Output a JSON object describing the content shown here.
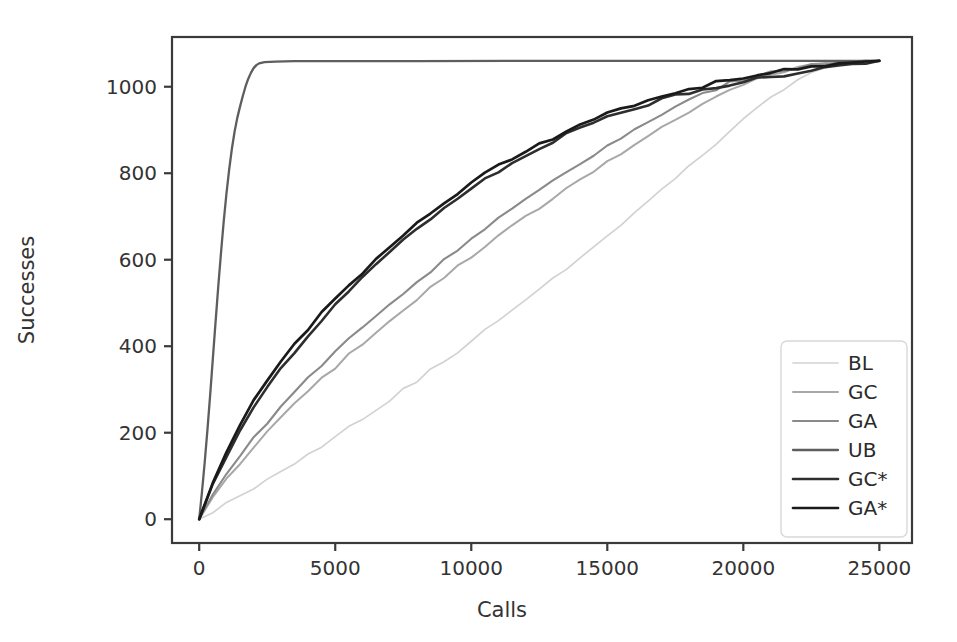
{
  "chart_data": {
    "type": "line",
    "title": "",
    "xlabel": "Calls",
    "ylabel": "Successes",
    "xlim": [
      -1000,
      26200
    ],
    "ylim": [
      -55,
      1115
    ],
    "xticks": [
      0,
      5000,
      10000,
      15000,
      20000,
      25000
    ],
    "xtick_labels": [
      "0",
      "5000",
      "10000",
      "15000",
      "20000",
      "25000"
    ],
    "yticks": [
      0,
      200,
      400,
      600,
      800,
      1000
    ],
    "ytick_labels": [
      "0",
      "200",
      "400",
      "600",
      "800",
      "1000"
    ],
    "grid": false,
    "legend_position": "lower right",
    "max_successes": 1060,
    "series": [
      {
        "name": "BL",
        "color": "#d2d2d2",
        "width": 1.7,
        "x": [
          0,
          500,
          1000,
          1500,
          2000,
          2500,
          3000,
          3500,
          4000,
          4500,
          5000,
          5500,
          6000,
          6500,
          7000,
          7500,
          8000,
          8500,
          9000,
          9500,
          10000,
          10500,
          11000,
          11500,
          12000,
          12500,
          13000,
          13500,
          14000,
          14500,
          15000,
          15500,
          16000,
          16500,
          17000,
          17500,
          18000,
          18500,
          19000,
          19500,
          20000,
          20500,
          21000,
          21500,
          22000,
          22500,
          23000,
          23500,
          24000,
          24500,
          25000
        ],
        "y": [
          0,
          18,
          36,
          54,
          73,
          92,
          111,
          131,
          151,
          171,
          192,
          213,
          234,
          255,
          277,
          299,
          321,
          343,
          366,
          389,
          412,
          435,
          459,
          483,
          507,
          531,
          556,
          581,
          606,
          631,
          657,
          683,
          709,
          735,
          762,
          789,
          816,
          843,
          871,
          899,
          927,
          953,
          975,
          995,
          1014,
          1029,
          1041,
          1050,
          1056,
          1059,
          1060
        ]
      },
      {
        "name": "GC",
        "color": "#a8a8a8",
        "width": 2.0,
        "x": [
          0,
          500,
          1000,
          1500,
          2000,
          2500,
          3000,
          3500,
          4000,
          4500,
          5000,
          5500,
          6000,
          6500,
          7000,
          7500,
          8000,
          8500,
          9000,
          9500,
          10000,
          10500,
          11000,
          11500,
          12000,
          12500,
          13000,
          13500,
          14000,
          14500,
          15000,
          15500,
          16000,
          16500,
          17000,
          17500,
          18000,
          18500,
          19000,
          19500,
          20000,
          20500,
          21000,
          21500,
          22000,
          22500,
          23000,
          23500,
          24000,
          24500,
          25000
        ],
        "y": [
          0,
          48,
          92,
          131,
          167,
          201,
          233,
          264,
          294,
          323,
          351,
          379,
          406,
          433,
          459,
          485,
          510,
          535,
          559,
          583,
          607,
          630,
          653,
          676,
          698,
          720,
          742,
          763,
          784,
          805,
          826,
          846,
          866,
          886,
          905,
          924,
          942,
          960,
          977,
          993,
          1007,
          1019,
          1029,
          1037,
          1044,
          1049,
          1053,
          1056,
          1058,
          1059,
          1060
        ]
      },
      {
        "name": "GA",
        "color": "#8a8a8a",
        "width": 2.1,
        "x": [
          0,
          500,
          1000,
          1500,
          2000,
          2500,
          3000,
          3500,
          4000,
          4500,
          5000,
          5500,
          6000,
          6500,
          7000,
          7500,
          8000,
          8500,
          9000,
          9500,
          10000,
          10500,
          11000,
          11500,
          12000,
          12500,
          13000,
          13500,
          14000,
          14500,
          15000,
          15500,
          16000,
          16500,
          17000,
          17500,
          18000,
          18500,
          19000,
          19500,
          20000,
          20500,
          21000,
          21500,
          22000,
          22500,
          23000,
          23500,
          24000,
          24500,
          25000
        ],
        "y": [
          0,
          56,
          105,
          148,
          188,
          225,
          260,
          293,
          325,
          356,
          386,
          415,
          443,
          471,
          498,
          524,
          550,
          575,
          600,
          624,
          648,
          671,
          694,
          716,
          738,
          760,
          781,
          802,
          822,
          842,
          861,
          880,
          899,
          917,
          934,
          951,
          967,
          982,
          996,
          1008,
          1018,
          1027,
          1034,
          1040,
          1046,
          1050,
          1053,
          1056,
          1058,
          1059,
          1060
        ]
      },
      {
        "name": "UB",
        "color": "#5e5e5e",
        "width": 2.3,
        "x": [
          0,
          100,
          200,
          300,
          400,
          500,
          600,
          700,
          800,
          900,
          1000,
          1100,
          1200,
          1300,
          1400,
          1500,
          1600,
          1700,
          1800,
          1900,
          2000,
          2100,
          2200,
          2400,
          2800,
          3500,
          5000,
          8000,
          12000,
          16000,
          20000,
          25000
        ],
        "y": [
          0,
          62,
          130,
          205,
          285,
          370,
          455,
          538,
          615,
          688,
          752,
          808,
          856,
          896,
          928,
          954,
          978,
          1000,
          1018,
          1032,
          1043,
          1050,
          1054,
          1057,
          1058,
          1059,
          1059,
          1059,
          1060,
          1060,
          1060,
          1060
        ]
      },
      {
        "name": "GC*",
        "color": "#2e2e2e",
        "width": 2.6,
        "x": [
          0,
          500,
          1000,
          1500,
          2000,
          2500,
          3000,
          3500,
          4000,
          4500,
          5000,
          5500,
          6000,
          6500,
          7000,
          7500,
          8000,
          8500,
          9000,
          9500,
          10000,
          10500,
          11000,
          11500,
          12000,
          12500,
          13000,
          13500,
          14000,
          14500,
          15000,
          15500,
          16000,
          16500,
          17000,
          17500,
          18000,
          18500,
          19000,
          19500,
          20000,
          20500,
          21000,
          21500,
          22000,
          22500,
          23000,
          23500,
          24000,
          24500,
          25000
        ],
        "y": [
          0,
          78,
          145,
          203,
          255,
          302,
          345,
          386,
          424,
          460,
          494,
          527,
          559,
          590,
          618,
          644,
          669,
          694,
          718,
          741,
          763,
          784,
          804,
          823,
          841,
          858,
          874,
          889,
          903,
          916,
          928,
          939,
          950,
          960,
          969,
          978,
          986,
          993,
          1000,
          1006,
          1012,
          1018,
          1023,
          1028,
          1033,
          1038,
          1043,
          1048,
          1053,
          1057,
          1060
        ]
      },
      {
        "name": "GA*",
        "color": "#1a1a1a",
        "width": 2.7,
        "x": [
          0,
          500,
          1000,
          1500,
          2000,
          2500,
          3000,
          3500,
          4000,
          4500,
          5000,
          5500,
          6000,
          6500,
          7000,
          7500,
          8000,
          8500,
          9000,
          9500,
          10000,
          10500,
          11000,
          11500,
          12000,
          12500,
          13000,
          13500,
          14000,
          14500,
          15000,
          15500,
          16000,
          16500,
          17000,
          17500,
          18000,
          18500,
          19000,
          19500,
          20000,
          20500,
          21000,
          21500,
          22000,
          22500,
          23000,
          23500,
          24000,
          24500,
          25000
        ],
        "y": [
          0,
          86,
          158,
          219,
          272,
          320,
          364,
          404,
          441,
          476,
          509,
          541,
          572,
          602,
          631,
          659,
          686,
          711,
          734,
          756,
          777,
          797,
          816,
          834,
          851,
          867,
          882,
          897,
          911,
          924,
          936,
          948,
          959,
          969,
          978,
          987,
          995,
          1002,
          1009,
          1015,
          1021,
          1027,
          1032,
          1037,
          1042,
          1047,
          1051,
          1055,
          1057,
          1059,
          1060
        ]
      }
    ]
  }
}
